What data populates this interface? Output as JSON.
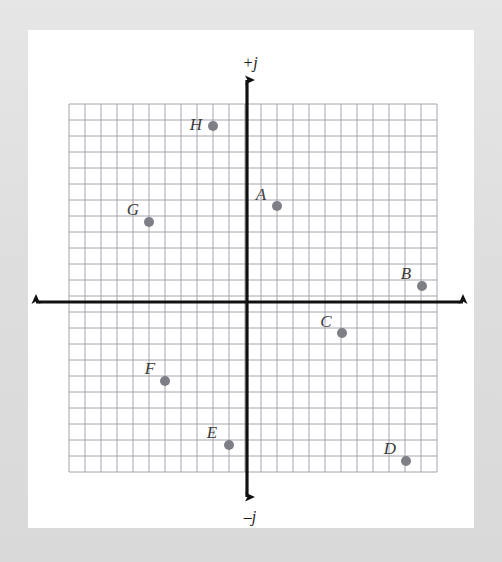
{
  "figure": {
    "axis_labels": {
      "positive_imaginary": "+j",
      "negative_imaginary": "–j"
    },
    "colors": {
      "page_background": "#e2e2e2",
      "paper": "#ffffff",
      "grid_line": "#9a9aa5",
      "grid_line_minor": "#b8b8c2",
      "axis": "#111111",
      "point_fill": "#7e7e86",
      "label_text": "#3a3a3a"
    },
    "grid": {
      "cell_px": 16,
      "origin_px": {
        "x": 247,
        "y": 302
      },
      "left_px": 69,
      "top_px": 104,
      "right_px": 437,
      "bottom_px": 472,
      "cells_x": 23,
      "cells_y": 23,
      "x_min_units": -11,
      "x_max_units": 12,
      "y_min_units": -11,
      "y_max_units": 12
    },
    "axes": {
      "vertical_top_px": 80,
      "vertical_bottom_px": 497,
      "horizontal_left_px": 36,
      "horizontal_right_px": 463
    }
  },
  "chart_data": {
    "type": "scatter",
    "title": "",
    "xlabel": "",
    "ylabel": "",
    "axis_labels": {
      "up": "+j",
      "down": "–j"
    },
    "grid": true,
    "legend": "none",
    "xlim": [
      -11,
      12
    ],
    "ylim": [
      -11,
      12
    ],
    "unit_per_cell": 1,
    "points": [
      {
        "label": "A",
        "x": 2,
        "y": 6,
        "px": 277,
        "py": 206,
        "label_px": 261,
        "label_py": 200
      },
      {
        "label": "B",
        "x": 11,
        "y": 1,
        "px": 422,
        "py": 286,
        "label_px": 406,
        "label_py": 279
      },
      {
        "label": "C",
        "x": 6,
        "y": -2,
        "px": 342,
        "py": 333,
        "label_px": 326,
        "label_py": 327
      },
      {
        "label": "D",
        "x": 10,
        "y": -10,
        "px": 406,
        "py": 461,
        "label_px": 390,
        "label_py": 454
      },
      {
        "label": "E",
        "x": -1,
        "y": -9,
        "px": 229,
        "py": 445,
        "label_px": 212,
        "label_py": 438
      },
      {
        "label": "F",
        "x": -5,
        "y": -5,
        "px": 165,
        "py": 381,
        "label_px": 150,
        "label_py": 374
      },
      {
        "label": "G",
        "x": -6,
        "y": 5,
        "px": 149,
        "py": 222,
        "label_px": 133,
        "label_py": 215
      },
      {
        "label": "H",
        "x": -2,
        "y": 11,
        "px": 213,
        "py": 126,
        "label_px": 196,
        "label_py": 130
      }
    ]
  }
}
